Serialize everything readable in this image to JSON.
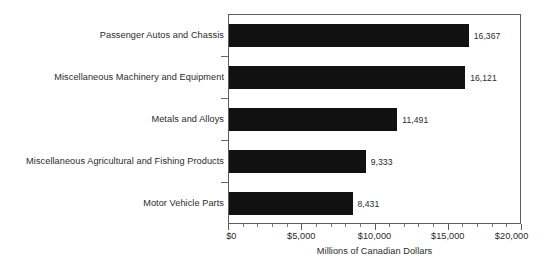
{
  "chart_data": {
    "type": "bar",
    "orientation": "horizontal",
    "title": "",
    "xlabel": "Millions of Canadian Dollars",
    "ylabel": "",
    "xlim": [
      0,
      20000
    ],
    "xticks": [
      0,
      5000,
      10000,
      15000,
      20000
    ],
    "xtick_labels": [
      "$0",
      "$5,000",
      "$10,000",
      "$15,000",
      "$20,000"
    ],
    "minor_tick_interval": 1000,
    "grid": false,
    "legend": null,
    "bar_color": "#111111",
    "categories": [
      "Passenger Autos and Chassis",
      "Miscellaneous Machinery and Equipment",
      "Metals and Alloys",
      "Miscellaneous Agricultural and Fishing Products",
      "Motor Vehicle Parts"
    ],
    "values": [
      16367,
      16121,
      11491,
      9333,
      8431
    ],
    "value_labels": [
      "16,367",
      "16,121",
      "11,491",
      "9,333",
      "8,431"
    ]
  }
}
